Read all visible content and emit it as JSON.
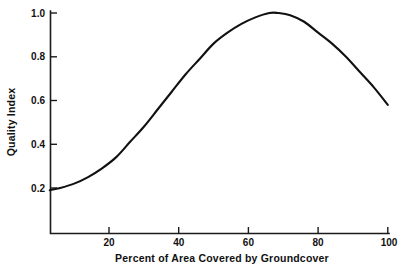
{
  "chart_data": {
    "type": "line",
    "title": "",
    "xlabel": "Percent of Area Covered by Groundcover",
    "ylabel": "Quality Index",
    "xlim": [
      3,
      100
    ],
    "ylim": [
      -0.07,
      1.04
    ],
    "grid": false,
    "legend": false,
    "legend_position": "none",
    "xticks": [
      20,
      40,
      60,
      80,
      100
    ],
    "xtick_labels": [
      "20",
      "40",
      "60",
      "80",
      "100"
    ],
    "yticks": [
      0.2,
      0.4,
      0.6,
      0.8,
      1.0
    ],
    "ytick_labels": [
      "0.2",
      "0.4",
      "0.6",
      "0.8",
      "1.0"
    ],
    "series": [
      {
        "name": "Quality Index",
        "color": "#111111",
        "x": [
          3,
          6,
          10,
          14,
          18,
          22,
          26,
          30,
          34,
          38,
          42,
          46,
          50,
          54,
          58,
          62,
          66,
          68.5,
          72,
          76,
          80,
          84,
          88,
          92,
          96,
          100
        ],
        "values": [
          0.19,
          0.2,
          0.22,
          0.25,
          0.29,
          0.34,
          0.41,
          0.48,
          0.56,
          0.64,
          0.72,
          0.79,
          0.86,
          0.91,
          0.95,
          0.98,
          1.0,
          1.0,
          0.99,
          0.96,
          0.91,
          0.86,
          0.8,
          0.73,
          0.66,
          0.58
        ]
      }
    ],
    "annotations": {
      "peak_x": 68.5,
      "peak_y": 1.0,
      "start_x": 3,
      "start_y": 0.19,
      "end_x": 100,
      "end_y": 0.58
    }
  },
  "axes": {
    "x_title": "Percent of Area Covered by Groundcover",
    "y_title": "Quality Index",
    "x_tick_labels": [
      "20",
      "40",
      "60",
      "80",
      "100"
    ],
    "y_tick_labels": [
      "0.2",
      "0.4",
      "0.6",
      "0.8",
      "1.0"
    ]
  },
  "style": {
    "line_color": "#111111",
    "axis_color": "#1a1a1a",
    "background": "#ffffff"
  }
}
